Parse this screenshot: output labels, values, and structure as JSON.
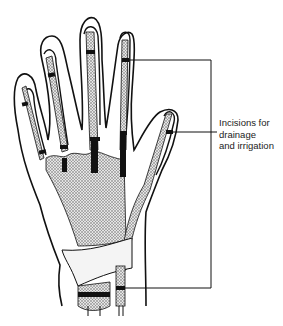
{
  "figure": {
    "annotation": {
      "lines": [
        "Incisions for",
        "drainage",
        "and irrigation"
      ]
    },
    "colors": {
      "ink": "#111111",
      "stipple": "#9a9a9a",
      "background": "#ffffff"
    }
  }
}
